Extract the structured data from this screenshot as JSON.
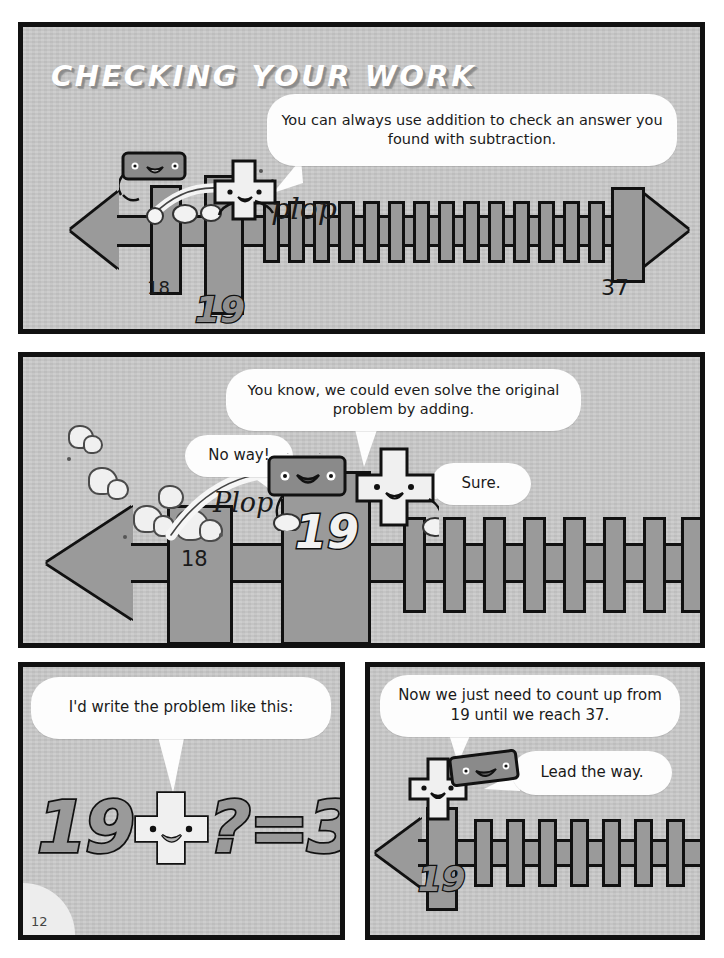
{
  "page": {
    "title": "CHECKING YOUR WORK",
    "page_number": "12",
    "colors": {
      "panel_bg": "#c9c9c9",
      "panel_border": "#111111",
      "numberline_fill": "#9a9a9a",
      "balloon_bg": "#fdfdfd",
      "ink": "#1a1a1a",
      "title_text": "#ffffff",
      "title_shadow": "#8c8c8c"
    }
  },
  "panels": [
    {
      "id": "panel-1",
      "balloons": [
        {
          "id": "p1-narration",
          "text": "You can always use addition to check an answer you found with subtraction."
        }
      ],
      "sfx": [
        {
          "id": "p1-plop",
          "text": "plop"
        }
      ],
      "numberline": {
        "left_arrow": true,
        "right_arrow": true,
        "labels": [
          {
            "id": "p1-label-18",
            "value": "18"
          },
          {
            "id": "p1-label-19",
            "value": "19"
          },
          {
            "id": "p1-label-37",
            "value": "37"
          }
        ]
      },
      "characters": [
        {
          "id": "minus-character",
          "name": "minus-sign-character"
        },
        {
          "id": "plus-character",
          "name": "plus-sign-character"
        }
      ]
    },
    {
      "id": "panel-2",
      "balloons": [
        {
          "id": "p2-narration",
          "text": "You know, we could even solve the original problem by adding."
        },
        {
          "id": "p2-noway",
          "text": "No way!"
        },
        {
          "id": "p2-sure",
          "text": "Sure."
        }
      ],
      "sfx": [
        {
          "id": "p2-plop",
          "text": "Plop"
        }
      ],
      "numberline": {
        "left_arrow": true,
        "right_arrow": false,
        "labels": [
          {
            "id": "p2-label-18",
            "value": "18"
          },
          {
            "id": "p2-label-19",
            "value": "19"
          }
        ]
      },
      "characters": [
        {
          "id": "minus-character",
          "name": "minus-sign-character"
        },
        {
          "id": "plus-character",
          "name": "plus-sign-character"
        }
      ]
    },
    {
      "id": "panel-3",
      "balloons": [
        {
          "id": "p3-line",
          "text": "I'd write the problem like this:"
        }
      ],
      "equation": {
        "left_operand": "19",
        "operator_character": "plus-sign-character",
        "unknown": "?",
        "equals": "=",
        "right_operand": "37"
      }
    },
    {
      "id": "panel-4",
      "balloons": [
        {
          "id": "p4-narration",
          "text": "Now we just need to count up from 19 until we reach 37."
        },
        {
          "id": "p4-lead",
          "text": "Lead the way."
        }
      ],
      "numberline": {
        "left_arrow": true,
        "right_arrow": false,
        "labels": [
          {
            "id": "p4-label-19",
            "value": "19"
          }
        ]
      },
      "characters": [
        {
          "id": "plus-character",
          "name": "plus-sign-character"
        },
        {
          "id": "minus-character",
          "name": "minus-sign-character"
        }
      ]
    }
  ]
}
